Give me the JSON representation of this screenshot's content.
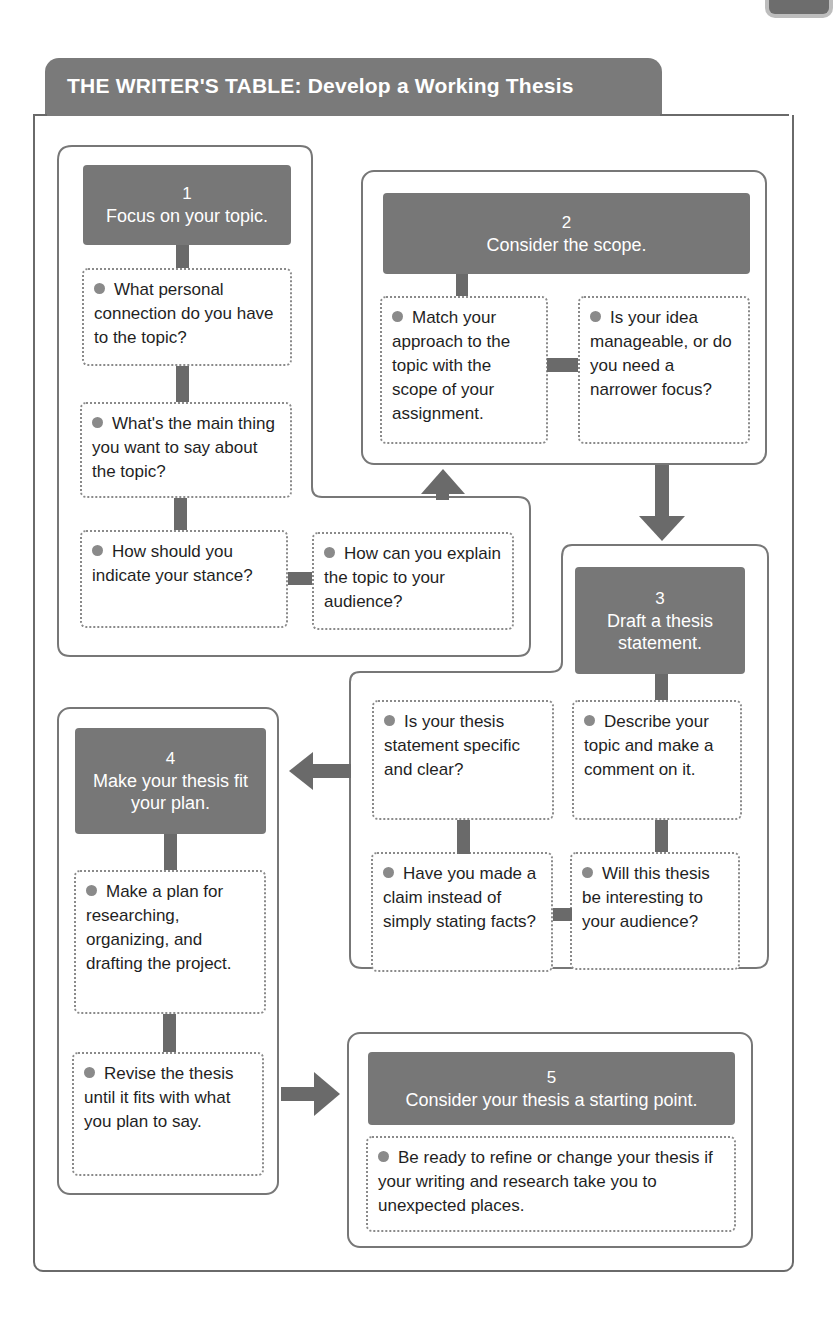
{
  "title": "THE WRITER'S TABLE: Develop a Working Thesis",
  "colors": {
    "header_fill": "#7a7a7a",
    "step_fill": "#777777",
    "outline": "#777777",
    "bullet": "#8a8a8a",
    "connector": "#6a6a6a"
  },
  "steps": [
    {
      "number": "1",
      "title": "Focus on your topic.",
      "items": [
        "What personal connection do you have to the topic?",
        "What's the main thing you want to say about the topic?",
        "How should you indicate your stance?",
        "How can you explain the topic to your audience?"
      ]
    },
    {
      "number": "2",
      "title": "Consider the scope.",
      "items": [
        "Match your approach to the topic with the scope of your assignment.",
        "Is your idea manageable, or do you need a narrower focus?"
      ]
    },
    {
      "number": "3",
      "title": "Draft a thesis statement.",
      "items": [
        "Describe your topic and make a comment on it.",
        "Will this thesis be interesting to your audience?",
        "Have you made a claim instead of simply stating facts?",
        "Is your thesis statement specific and clear?"
      ]
    },
    {
      "number": "4",
      "title": "Make your thesis fit your plan.",
      "items": [
        "Make a plan for researching, organizing, and drafting the project.",
        "Revise the thesis until it fits with what you plan to say."
      ]
    },
    {
      "number": "5",
      "title": "Consider your thesis a starting point.",
      "items": [
        "Be ready to refine or change your thesis if your writing and research take you to unexpected places."
      ]
    }
  ],
  "flow_arrows": [
    {
      "from": "1",
      "to": "2",
      "direction": "up"
    },
    {
      "from": "2",
      "to": "3",
      "direction": "down"
    },
    {
      "from": "3",
      "to": "4",
      "direction": "left"
    },
    {
      "from": "4",
      "to": "5",
      "direction": "right"
    }
  ]
}
